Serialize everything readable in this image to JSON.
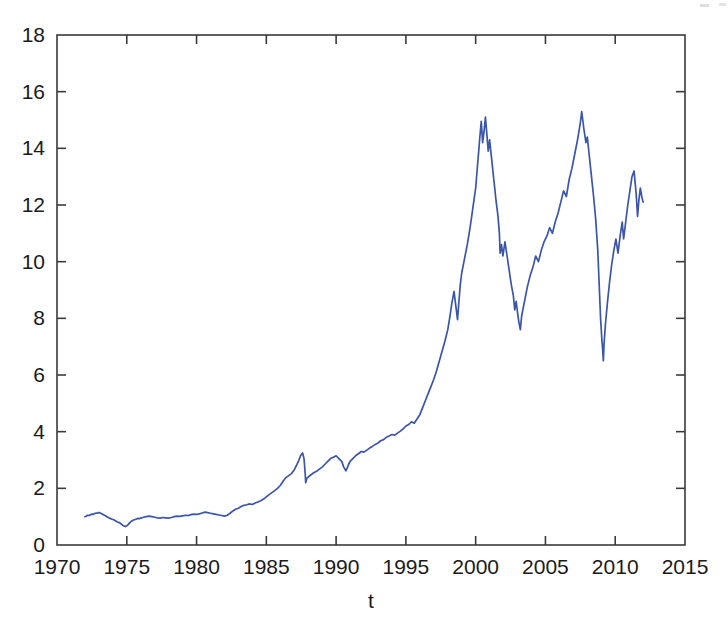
{
  "chart_data": {
    "type": "line",
    "title": "",
    "subtitle": "",
    "xlabel": "t",
    "ylabel": "",
    "xlim": [
      1970,
      2015
    ],
    "ylim": [
      0,
      18
    ],
    "xticks": [
      1970,
      1975,
      1980,
      1985,
      1990,
      1995,
      2000,
      2005,
      2010,
      2015
    ],
    "xticklabels": [
      "1970",
      "1975",
      "1980",
      "1985",
      "1990",
      "1995",
      "2000",
      "2005",
      "2010",
      "2015"
    ],
    "yticks": [
      0,
      2,
      4,
      6,
      8,
      10,
      12,
      14,
      16,
      18
    ],
    "yticklabels": [
      "0",
      "2",
      "4",
      "6",
      "8",
      "10",
      "12",
      "14",
      "16",
      "18"
    ],
    "grid": false,
    "legend": null,
    "legend_position": "none",
    "annotations": [],
    "box": true,
    "tick_direction": "in",
    "series": [
      {
        "name": "series-1",
        "color": "#3b56a8",
        "linewidth": 1.7,
        "x": [
          1972.0,
          1972.1,
          1972.2,
          1972.3,
          1972.4,
          1972.5,
          1972.6,
          1972.7,
          1972.8,
          1972.9,
          1973.0,
          1973.1,
          1973.2,
          1973.3,
          1973.4,
          1973.5,
          1973.6,
          1973.7,
          1973.8,
          1973.9,
          1974.0,
          1974.1,
          1974.2,
          1974.3,
          1974.4,
          1974.5,
          1974.6,
          1974.7,
          1974.8,
          1974.9,
          1975.0,
          1975.1,
          1975.2,
          1975.3,
          1975.4,
          1975.5,
          1975.6,
          1975.7,
          1975.8,
          1975.9,
          1976.0,
          1976.2,
          1976.4,
          1976.6,
          1976.8,
          1977.0,
          1977.2,
          1977.4,
          1977.6,
          1977.8,
          1978.0,
          1978.2,
          1978.4,
          1978.6,
          1978.8,
          1979.0,
          1979.2,
          1979.4,
          1979.6,
          1979.8,
          1980.0,
          1980.2,
          1980.4,
          1980.6,
          1980.8,
          1981.0,
          1981.2,
          1981.4,
          1981.6,
          1981.8,
          1982.0,
          1982.2,
          1982.4,
          1982.6,
          1982.8,
          1983.0,
          1983.2,
          1983.4,
          1983.6,
          1983.8,
          1984.0,
          1984.2,
          1984.4,
          1984.6,
          1984.8,
          1985.0,
          1985.2,
          1985.4,
          1985.6,
          1985.8,
          1986.0,
          1986.2,
          1986.4,
          1986.6,
          1986.8,
          1987.0,
          1987.15,
          1987.3,
          1987.45,
          1987.6,
          1987.7,
          1987.78,
          1987.82,
          1987.9,
          1988.0,
          1988.2,
          1988.4,
          1988.6,
          1988.8,
          1989.0,
          1989.2,
          1989.4,
          1989.6,
          1989.8,
          1990.0,
          1990.2,
          1990.4,
          1990.55,
          1990.7,
          1990.8,
          1990.9,
          1991.0,
          1991.2,
          1991.4,
          1991.6,
          1991.8,
          1992.0,
          1992.2,
          1992.4,
          1992.6,
          1992.8,
          1993.0,
          1993.2,
          1993.4,
          1993.6,
          1993.8,
          1994.0,
          1994.2,
          1994.4,
          1994.6,
          1994.8,
          1995.0,
          1995.2,
          1995.4,
          1995.6,
          1995.8,
          1996.0,
          1996.2,
          1996.4,
          1996.6,
          1996.8,
          1997.0,
          1997.2,
          1997.4,
          1997.6,
          1997.8,
          1998.0,
          1998.15,
          1998.3,
          1998.45,
          1998.6,
          1998.7,
          1998.8,
          1998.9,
          1999.0,
          1999.2,
          1999.4,
          1999.6,
          1999.8,
          2000.0,
          2000.1,
          2000.2,
          2000.3,
          2000.4,
          2000.5,
          2000.6,
          2000.7,
          2000.8,
          2000.9,
          2001.0,
          2001.15,
          2001.3,
          2001.45,
          2001.6,
          2001.7,
          2001.75,
          2001.85,
          2001.95,
          2002.1,
          2002.25,
          2002.4,
          2002.55,
          2002.7,
          2002.8,
          2002.9,
          2003.0,
          2003.1,
          2003.2,
          2003.3,
          2003.5,
          2003.7,
          2003.9,
          2004.1,
          2004.3,
          2004.5,
          2004.7,
          2004.9,
          2005.1,
          2005.3,
          2005.5,
          2005.7,
          2005.9,
          2006.1,
          2006.3,
          2006.5,
          2006.7,
          2006.9,
          2007.1,
          2007.3,
          2007.5,
          2007.6,
          2007.75,
          2007.9,
          2008.0,
          2008.15,
          2008.3,
          2008.45,
          2008.6,
          2008.75,
          2008.85,
          2008.95,
          2009.05,
          2009.1,
          2009.15,
          2009.2,
          2009.3,
          2009.45,
          2009.6,
          2009.75,
          2009.9,
          2010.05,
          2010.2,
          2010.35,
          2010.5,
          2010.6,
          2010.75,
          2010.9,
          2011.05,
          2011.2,
          2011.35,
          2011.5,
          2011.6,
          2011.7,
          2011.8,
          2011.9,
          2012.0
        ],
        "y": [
          1.0,
          1.02,
          1.05,
          1.04,
          1.07,
          1.09,
          1.08,
          1.11,
          1.13,
          1.12,
          1.15,
          1.13,
          1.1,
          1.08,
          1.05,
          1.02,
          0.99,
          0.96,
          0.94,
          0.92,
          0.9,
          0.88,
          0.85,
          0.82,
          0.8,
          0.78,
          0.74,
          0.7,
          0.67,
          0.65,
          0.68,
          0.72,
          0.78,
          0.83,
          0.86,
          0.88,
          0.9,
          0.92,
          0.94,
          0.93,
          0.95,
          0.98,
          1.0,
          1.02,
          1.0,
          0.98,
          0.96,
          0.95,
          0.97,
          0.96,
          0.95,
          0.97,
          1.0,
          1.02,
          1.01,
          1.03,
          1.05,
          1.04,
          1.07,
          1.09,
          1.08,
          1.1,
          1.13,
          1.16,
          1.14,
          1.12,
          1.1,
          1.08,
          1.06,
          1.04,
          1.02,
          1.05,
          1.12,
          1.2,
          1.26,
          1.3,
          1.36,
          1.4,
          1.42,
          1.45,
          1.43,
          1.48,
          1.52,
          1.56,
          1.62,
          1.7,
          1.78,
          1.85,
          1.92,
          2.0,
          2.1,
          2.25,
          2.38,
          2.45,
          2.52,
          2.65,
          2.8,
          2.95,
          3.15,
          3.25,
          3.05,
          2.55,
          2.2,
          2.35,
          2.4,
          2.48,
          2.55,
          2.6,
          2.68,
          2.75,
          2.85,
          2.95,
          3.05,
          3.1,
          3.15,
          3.05,
          2.95,
          2.75,
          2.62,
          2.72,
          2.85,
          2.95,
          3.05,
          3.15,
          3.22,
          3.3,
          3.28,
          3.35,
          3.42,
          3.48,
          3.55,
          3.6,
          3.68,
          3.72,
          3.8,
          3.85,
          3.9,
          3.88,
          3.95,
          4.02,
          4.1,
          4.2,
          4.25,
          4.35,
          4.3,
          4.45,
          4.6,
          4.85,
          5.1,
          5.35,
          5.6,
          5.85,
          6.15,
          6.5,
          6.85,
          7.2,
          7.6,
          8.05,
          8.55,
          8.95,
          8.35,
          7.95,
          8.6,
          9.2,
          9.6,
          10.1,
          10.6,
          11.2,
          11.9,
          12.6,
          13.2,
          13.8,
          14.4,
          14.95,
          14.2,
          14.6,
          15.1,
          14.5,
          13.9,
          14.3,
          13.6,
          12.9,
          12.2,
          11.6,
          11.0,
          10.3,
          10.6,
          10.2,
          10.7,
          10.2,
          9.7,
          9.2,
          8.8,
          8.3,
          8.6,
          8.2,
          7.85,
          7.6,
          8.1,
          8.6,
          9.1,
          9.5,
          9.8,
          10.2,
          10.0,
          10.4,
          10.7,
          10.9,
          11.2,
          11.0,
          11.4,
          11.7,
          12.1,
          12.5,
          12.3,
          12.9,
          13.3,
          13.8,
          14.3,
          14.9,
          15.3,
          14.7,
          14.2,
          14.4,
          13.7,
          13.0,
          12.3,
          11.5,
          10.4,
          9.2,
          8.0,
          7.2,
          6.9,
          6.5,
          7.1,
          7.8,
          8.6,
          9.3,
          9.9,
          10.4,
          10.8,
          10.3,
          10.9,
          11.4,
          10.8,
          11.4,
          12.0,
          12.5,
          13.0,
          13.2,
          12.4,
          11.6,
          12.2,
          12.6,
          12.3,
          12.1
        ]
      }
    ]
  },
  "figure": {
    "background_color": "#ffffff",
    "axis_color": "#3a3a3a",
    "line_color": "#3b56a8"
  }
}
